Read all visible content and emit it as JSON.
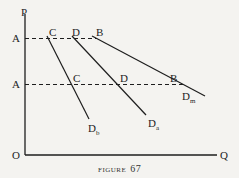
{
  "figure": {
    "caption_word": "FIGURE",
    "caption_number": "67"
  },
  "axes": {
    "y_label": "P",
    "x_label": "Q",
    "origin_label": "O"
  },
  "price_levels": [
    {
      "label": "A",
      "position": "upper"
    },
    {
      "label": "A",
      "position": "lower"
    }
  ],
  "curves": [
    {
      "name": "Db",
      "main": "D",
      "subscript": "b",
      "upper_point": "C",
      "lower_point": "C"
    },
    {
      "name": "Da",
      "main": "D",
      "subscript": "a",
      "upper_point": "D",
      "lower_point": "D"
    },
    {
      "name": "Dm",
      "main": "D",
      "subscript": "m",
      "upper_point": "B",
      "lower_point": "B"
    }
  ],
  "colors": {
    "background": "#f4f3f0",
    "ink": "#1e1e1e"
  }
}
